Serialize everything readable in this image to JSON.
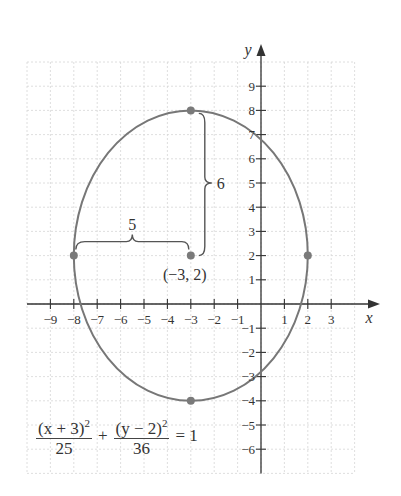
{
  "chart_data": {
    "type": "diagram",
    "equation": {
      "term1": {
        "numerator": "(x + 3)",
        "exponent": "2",
        "denominator": "25"
      },
      "plus": "+",
      "term2": {
        "numerator": "(y − 2)",
        "exponent": "2",
        "denominator": "36"
      },
      "rhs": "= 1"
    },
    "axes": {
      "xlabel": "x",
      "ylabel": "y",
      "x_ticks": [
        -9,
        -8,
        -7,
        -6,
        -5,
        -4,
        -3,
        -2,
        -1,
        1,
        2,
        3
      ],
      "y_ticks": [
        -6,
        -5,
        -4,
        -3,
        -2,
        -1,
        1,
        2,
        3,
        4,
        5,
        6,
        7,
        8,
        9
      ],
      "grid": true,
      "grid_x_range": [
        -10,
        4
      ],
      "grid_y_range": [
        -7,
        10
      ]
    },
    "ellipse": {
      "center": [
        -3,
        2
      ],
      "a_horizontal": 5,
      "b_vertical": 6,
      "color": "#777777"
    },
    "points": [
      {
        "name": "center",
        "x": -3,
        "y": 2,
        "label": "(−3, 2)"
      },
      {
        "name": "top-vertex",
        "x": -3,
        "y": 8
      },
      {
        "name": "bottom-vertex",
        "x": -3,
        "y": -4
      },
      {
        "name": "left-covertex",
        "x": -8,
        "y": 2
      },
      {
        "name": "right-covertex",
        "x": 2,
        "y": 2
      }
    ],
    "annotations": {
      "horizontal_brace_label": "5",
      "vertical_brace_label": "6"
    },
    "colors": {
      "curve": "#777777",
      "point": "#7a7a7a",
      "axis": "#333333",
      "grid": "#d6d6d6"
    }
  }
}
